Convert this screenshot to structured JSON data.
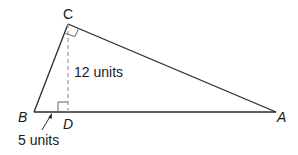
{
  "diagram": {
    "type": "geometry-triangle",
    "vertices": {
      "A": {
        "label": "A",
        "x": 276,
        "y": 112
      },
      "B": {
        "label": "B",
        "x": 34,
        "y": 112
      },
      "C": {
        "label": "C",
        "x": 68,
        "y": 24
      },
      "D": {
        "label": "D",
        "x": 68,
        "y": 112
      }
    },
    "altitude": {
      "from": "C",
      "to": "D",
      "style": "dashed",
      "label": "12 units"
    },
    "segment_bd": {
      "label": "5 units"
    },
    "right_angles": [
      "ACB",
      "CDB"
    ],
    "colors": {
      "stroke": "#2a2a2a",
      "dashed": "#9a9a9a",
      "text": "#1a1a1a"
    }
  }
}
